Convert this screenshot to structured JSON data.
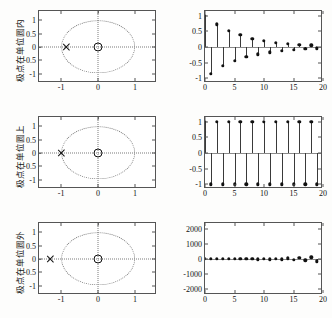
{
  "figure": {
    "title": "",
    "rows": [
      {
        "id": "inside",
        "ylabel": "极点在单位圆内",
        "pole_zero": {
          "type": "scatter",
          "xlabel": "",
          "ylabel": "",
          "xlim": [
            -1.6,
            1.6
          ],
          "ylim": [
            -1.35,
            1.35
          ],
          "xticks": [
            -1,
            0,
            1
          ],
          "xticklabels": [
            "-1",
            "0",
            "1"
          ],
          "yticks": [
            -1,
            -0.5,
            0,
            0.5,
            1
          ],
          "yticklabels": [
            "-1",
            "-0.5",
            "0",
            "0.5",
            "1"
          ],
          "unit_circle": true,
          "poles": [
            {
              "x": -0.85,
              "y": 0,
              "marker": "x"
            }
          ],
          "zeros": [
            {
              "x": 0,
              "y": 0,
              "marker": "o"
            }
          ]
        },
        "stem": {
          "type": "line",
          "xlabel": "",
          "ylabel": "",
          "xlim": [
            0,
            20
          ],
          "ylim": [
            -1.15,
            1.15
          ],
          "xticks": [
            0,
            5,
            10,
            15,
            20
          ],
          "xticklabels": [
            "0",
            "5",
            "10",
            "15",
            "20"
          ],
          "yticks": [
            -1,
            -0.5,
            0,
            0.5,
            1
          ],
          "yticklabels": [
            "-1",
            "-0.5",
            "0",
            "0.5",
            "1"
          ],
          "x": [
            0,
            1,
            2,
            3,
            4,
            5,
            6,
            7,
            8,
            9,
            10,
            11,
            12,
            13,
            14,
            15,
            16,
            17,
            18,
            19
          ],
          "values": [
            1,
            -0.85,
            0.72,
            -0.61,
            0.52,
            -0.44,
            0.38,
            -0.32,
            0.27,
            -0.23,
            0.2,
            -0.17,
            0.14,
            -0.12,
            0.1,
            -0.09,
            0.075,
            -0.064,
            0.054,
            -0.046
          ]
        }
      },
      {
        "id": "on",
        "ylabel": "极点在单位圆上",
        "pole_zero": {
          "type": "scatter",
          "xlabel": "",
          "ylabel": "",
          "xlim": [
            -1.6,
            1.6
          ],
          "ylim": [
            -1.35,
            1.35
          ],
          "xticks": [
            -1,
            0,
            1
          ],
          "xticklabels": [
            "-1",
            "0",
            "1"
          ],
          "yticks": [
            -1,
            -0.5,
            0,
            0.5,
            1
          ],
          "yticklabels": [
            "-1",
            "-0.5",
            "0",
            "0.5",
            "1"
          ],
          "unit_circle": true,
          "poles": [
            {
              "x": -1,
              "y": 0,
              "marker": "x"
            }
          ],
          "zeros": [
            {
              "x": 0,
              "y": 0,
              "marker": "o"
            }
          ]
        },
        "stem": {
          "type": "line",
          "xlabel": "",
          "ylabel": "",
          "xlim": [
            0,
            20
          ],
          "ylim": [
            -1.15,
            1.15
          ],
          "xticks": [
            0,
            5,
            10,
            15,
            20
          ],
          "xticklabels": [
            "0",
            "5",
            "10",
            "15",
            "20"
          ],
          "yticks": [
            -1,
            -0.5,
            0,
            0.5,
            1
          ],
          "yticklabels": [
            "-1",
            "-0.5",
            "0",
            "0.5",
            "1"
          ],
          "x": [
            0,
            1,
            2,
            3,
            4,
            5,
            6,
            7,
            8,
            9,
            10,
            11,
            12,
            13,
            14,
            15,
            16,
            17,
            18,
            19
          ],
          "values": [
            1,
            -1,
            1,
            -1,
            1,
            -1,
            1,
            -1,
            1,
            -1,
            1,
            -1,
            1,
            -1,
            1,
            -1,
            1,
            -1,
            1,
            -1
          ]
        }
      },
      {
        "id": "outside",
        "ylabel": "极点在单位圆外",
        "pole_zero": {
          "type": "scatter",
          "xlabel": "",
          "ylabel": "",
          "xlim": [
            -1.6,
            1.6
          ],
          "ylim": [
            -1.35,
            1.35
          ],
          "xticks": [
            -1,
            0,
            1
          ],
          "xticklabels": [
            "-1",
            "0",
            "1"
          ],
          "yticks": [
            -1,
            -0.5,
            0,
            0.5,
            1
          ],
          "yticklabels": [
            "-1",
            "-0.5",
            "0",
            "0.5",
            "1"
          ],
          "unit_circle": true,
          "poles": [
            {
              "x": -1.3,
              "y": 0,
              "marker": "x"
            }
          ],
          "zeros": [
            {
              "x": 0,
              "y": 0,
              "marker": "o"
            }
          ]
        },
        "stem": {
          "type": "line",
          "xlabel": "",
          "ylabel": "",
          "xlim": [
            0,
            20
          ],
          "ylim": [
            -2400,
            2400
          ],
          "xticks": [
            0,
            5,
            10,
            15,
            20
          ],
          "xticklabels": [
            "0",
            "5",
            "10",
            "15",
            "20"
          ],
          "yticks": [
            -2000,
            -1000,
            0,
            1000,
            2000
          ],
          "yticklabels": [
            "-2000",
            "-1000",
            "0",
            "1000",
            "2000"
          ],
          "x": [
            0,
            1,
            2,
            3,
            4,
            5,
            6,
            7,
            8,
            9,
            10,
            11,
            12,
            13,
            14,
            15,
            16,
            17,
            18,
            19
          ],
          "values": [
            1,
            -1.3,
            1.69,
            -2.2,
            2.86,
            -3.71,
            4.83,
            -6.27,
            8.16,
            -10.6,
            13.8,
            -17.9,
            23.3,
            -30.3,
            39.4,
            -51.2,
            66.5,
            -86.5,
            112.5,
            -146.2
          ]
        }
      }
    ]
  },
  "chart_data": [
    {
      "type": "scatter",
      "title": "极点在单位圆内 — 零极点图",
      "xlabel": "Re",
      "ylabel": "Im",
      "xlim": [
        -1.6,
        1.6
      ],
      "ylim": [
        -1.35,
        1.35
      ],
      "xticklabels": [
        "-1",
        "0",
        "1"
      ],
      "yticklabels": [
        "-1",
        "-0.5",
        "0",
        "0.5",
        "1"
      ],
      "grid": false,
      "legend": "none",
      "annotations": [
        "dotted unit circle",
        "dotted real and imaginary axes"
      ],
      "series": [
        {
          "name": "pole",
          "marker": "x",
          "points": [
            [
              -0.85,
              0
            ]
          ]
        },
        {
          "name": "zero",
          "marker": "o",
          "points": [
            [
              0,
              0
            ]
          ]
        }
      ]
    },
    {
      "type": "line",
      "title": "极点在单位圆内 — 单位脉冲响应（收敛）",
      "xlabel": "n",
      "ylabel": "h(n)",
      "xlim": [
        0,
        20
      ],
      "ylim": [
        -1.15,
        1.15
      ],
      "xticklabels": [
        "0",
        "5",
        "10",
        "15",
        "20"
      ],
      "yticklabels": [
        "-1",
        "-0.5",
        "0",
        "0.5",
        "1"
      ],
      "grid": false,
      "legend": "none",
      "x": [
        0,
        1,
        2,
        3,
        4,
        5,
        6,
        7,
        8,
        9,
        10,
        11,
        12,
        13,
        14,
        15,
        16,
        17,
        18,
        19
      ],
      "values": [
        1,
        -0.85,
        0.72,
        -0.61,
        0.52,
        -0.44,
        0.38,
        -0.32,
        0.27,
        -0.23,
        0.2,
        -0.17,
        0.14,
        -0.12,
        0.1,
        -0.09,
        0.075,
        -0.064,
        0.054,
        -0.046
      ]
    },
    {
      "type": "scatter",
      "title": "极点在单位圆上 — 零极点图",
      "xlabel": "Re",
      "ylabel": "Im",
      "xlim": [
        -1.6,
        1.6
      ],
      "ylim": [
        -1.35,
        1.35
      ],
      "xticklabels": [
        "-1",
        "0",
        "1"
      ],
      "yticklabels": [
        "-1",
        "-0.5",
        "0",
        "0.5",
        "1"
      ],
      "grid": false,
      "legend": "none",
      "series": [
        {
          "name": "pole",
          "marker": "x",
          "points": [
            [
              -1,
              0
            ]
          ]
        },
        {
          "name": "zero",
          "marker": "o",
          "points": [
            [
              0,
              0
            ]
          ]
        }
      ]
    },
    {
      "type": "line",
      "title": "极点在单位圆上 — 单位脉冲响应（等幅振荡）",
      "xlabel": "n",
      "ylabel": "h(n)",
      "xlim": [
        0,
        20
      ],
      "ylim": [
        -1.15,
        1.15
      ],
      "xticklabels": [
        "0",
        "5",
        "10",
        "15",
        "20"
      ],
      "yticklabels": [
        "-1",
        "-0.5",
        "0",
        "0.5",
        "1"
      ],
      "grid": false,
      "legend": "none",
      "x": [
        0,
        1,
        2,
        3,
        4,
        5,
        6,
        7,
        8,
        9,
        10,
        11,
        12,
        13,
        14,
        15,
        16,
        17,
        18,
        19
      ],
      "values": [
        1,
        -1,
        1,
        -1,
        1,
        -1,
        1,
        -1,
        1,
        -1,
        1,
        -1,
        1,
        -1,
        1,
        -1,
        1,
        -1,
        1,
        -1
      ]
    },
    {
      "type": "scatter",
      "title": "极点在单位圆外 — 零极点图",
      "xlabel": "Re",
      "ylabel": "Im",
      "xlim": [
        -1.6,
        1.6
      ],
      "ylim": [
        -1.35,
        1.35
      ],
      "xticklabels": [
        "-1",
        "0",
        "1"
      ],
      "yticklabels": [
        "-1",
        "-0.5",
        "0",
        "0.5",
        "1"
      ],
      "grid": false,
      "legend": "none",
      "series": [
        {
          "name": "pole",
          "marker": "x",
          "points": [
            [
              -1.3,
              0
            ]
          ]
        },
        {
          "name": "zero",
          "marker": "o",
          "points": [
            [
              0,
              0
            ]
          ]
        }
      ]
    },
    {
      "type": "line",
      "title": "极点在单位圆外 — 单位脉冲响应（发散）",
      "xlabel": "n",
      "ylabel": "h(n)",
      "xlim": [
        0,
        20
      ],
      "ylim": [
        -2400,
        2400
      ],
      "xticklabels": [
        "0",
        "5",
        "10",
        "15",
        "20"
      ],
      "yticklabels": [
        "-2000",
        "-1000",
        "0",
        "1000",
        "2000"
      ],
      "grid": false,
      "legend": "none",
      "x": [
        0,
        1,
        2,
        3,
        4,
        5,
        6,
        7,
        8,
        9,
        10,
        11,
        12,
        13,
        14,
        15,
        16,
        17,
        18,
        19
      ],
      "values": [
        1,
        -1.3,
        1.69,
        -2.2,
        2.86,
        -3.71,
        4.83,
        -6.27,
        8.16,
        -10.6,
        13.8,
        -17.9,
        23.3,
        -30.3,
        39.4,
        -51.2,
        66.5,
        -86.5,
        112.5,
        -146.2
      ]
    }
  ]
}
